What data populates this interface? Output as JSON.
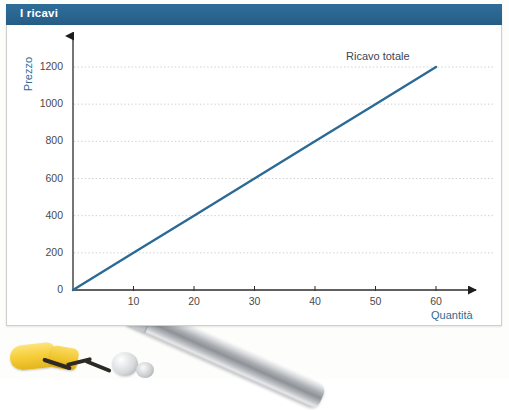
{
  "panel": {
    "title": "I ricavi",
    "title_bar_color": "#2a6590",
    "background_color": "#ffffff"
  },
  "chart_data": {
    "type": "line",
    "title": "I ricavi",
    "xlabel": "Quantità",
    "ylabel": "Prezzo",
    "xlim": [
      0,
      67
    ],
    "ylim": [
      0,
      1320
    ],
    "grid": true,
    "grid_style": "dotted-horizontal",
    "grid_color": "#cfcfcf",
    "legend_position": "inline-above-line",
    "x_ticks": [
      10,
      20,
      30,
      40,
      50,
      60
    ],
    "y_ticks": [
      0,
      200,
      400,
      600,
      800,
      1000,
      1200
    ],
    "x_tick_labels": [
      "10",
      "20",
      "30",
      "40",
      "50",
      "60"
    ],
    "y_tick_labels": [
      "0",
      "200",
      "400",
      "600",
      "800",
      "1000",
      "1200"
    ],
    "axis_arrowheads": true,
    "series": [
      {
        "name": "Ricavo totale",
        "color": "#2b6a96",
        "x": [
          0,
          10,
          20,
          30,
          40,
          50,
          60
        ],
        "values": [
          0,
          200,
          400,
          600,
          800,
          1000,
          1200
        ],
        "slope": 20,
        "intercept": 0
      }
    ]
  },
  "photo": {
    "objects": [
      "metal-pen",
      "yellow-clip",
      "gray-blob"
    ]
  }
}
